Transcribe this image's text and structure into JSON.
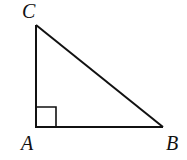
{
  "diagram": {
    "type": "right-triangle",
    "stroke_color": "#111111",
    "vertices": {
      "A": {
        "label": "A",
        "x": 36,
        "y": 127
      },
      "B": {
        "label": "B",
        "x": 163,
        "y": 127
      },
      "C": {
        "label": "C",
        "x": 36,
        "y": 25
      }
    },
    "right_angle_at": "A",
    "right_angle_marker_size": 20
  }
}
